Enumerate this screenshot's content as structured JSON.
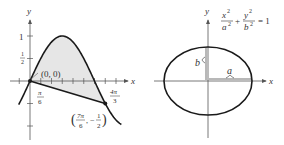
{
  "colors": {
    "ink": "#1a1a1a",
    "axis": "#555555",
    "shade": "#e6e6e6",
    "text": "#333333"
  },
  "left_figure": {
    "title": "Region between y = sin x and a line",
    "y_axis_label": "y",
    "x_axis_label": "x",
    "y_ticks": [
      {
        "value": 1,
        "label": "1"
      },
      {
        "value": 0.5,
        "label_num": "1",
        "label_den": "2"
      }
    ],
    "x_tick_labels": [
      {
        "num": "π",
        "den": "6"
      },
      {
        "num": "4π",
        "den": "3"
      }
    ],
    "points": [
      {
        "label": "(0, 0)",
        "x": 0,
        "y": 0
      },
      {
        "label_num_x": "7π",
        "label_den_x": "6",
        "label_num_y": "1",
        "label_den_y": "2",
        "sign_y": "−",
        "x": 3.6652,
        "y": -0.5
      }
    ],
    "curve": "y = sin x",
    "line": "segment from (0,0) to (7π/6, −1/2)",
    "x_range": [
      -0.6,
      4.6
    ],
    "y_range": [
      -1.4,
      1.6
    ]
  },
  "right_figure": {
    "title": "Ellipse",
    "y_axis_label": "y",
    "x_axis_label": "x",
    "equation": {
      "x_num": "x",
      "x_exp": "2",
      "x_den": "a",
      "x_den_exp": "2",
      "plus": "+",
      "y_num": "y",
      "y_exp": "2",
      "y_den": "b",
      "y_den_exp": "2",
      "equals": "= 1"
    },
    "semi_axis_labels": {
      "a": "a",
      "b": "b"
    }
  }
}
